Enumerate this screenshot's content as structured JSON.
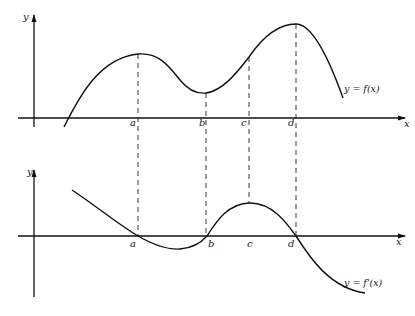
{
  "figure": {
    "top_graph": {
      "y_axis_label": "y",
      "x_axis_label": "x",
      "curve_label": "y = f(x)",
      "x_ticks": [
        "a",
        "b",
        "c",
        "d"
      ]
    },
    "bottom_graph": {
      "y_axis_label": "y",
      "x_axis_label": "x",
      "curve_label": "y = f'(x)",
      "x_ticks": [
        "a",
        "b",
        "c",
        "d"
      ]
    }
  }
}
